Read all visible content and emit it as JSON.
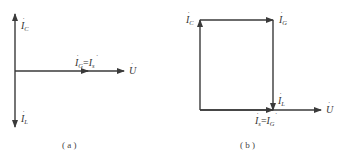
{
  "diagrams": [
    {
      "id": "a",
      "caption": "( a )",
      "vectors": [
        {
          "name": "I_C",
          "label_main": "I",
          "label_sub": "C",
          "direction": "up"
        },
        {
          "name": "I_L",
          "label_main": "I",
          "label_sub": "L",
          "direction": "down"
        },
        {
          "name": "I_G",
          "label_main": "I",
          "label_sub": "G",
          "direction": "right"
        },
        {
          "name": "U",
          "label_main": "U",
          "label_sub": "",
          "direction": "right"
        }
      ],
      "equation": {
        "left_main": "I",
        "left_sub": "G",
        "eq": "=",
        "right_main": "I",
        "right_sub": "s"
      }
    },
    {
      "id": "b",
      "caption": "( b )",
      "vectors": [
        {
          "name": "I_C",
          "label_main": "I",
          "label_sub": "C",
          "direction": "up"
        },
        {
          "name": "I_G_top",
          "label_main": "I",
          "label_sub": "G",
          "direction": "right"
        },
        {
          "name": "I_L",
          "label_main": "I",
          "label_sub": "L",
          "direction": "down"
        },
        {
          "name": "U",
          "label_main": "U",
          "label_sub": "",
          "direction": "right"
        }
      ],
      "equation": {
        "left_main": "I",
        "left_sub": "s",
        "eq": "=",
        "right_main": "I",
        "right_sub": "G"
      }
    }
  ],
  "colors": {
    "line": "#3a3a3a",
    "text": "#333333"
  }
}
